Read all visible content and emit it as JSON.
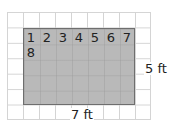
{
  "figure": {
    "width_label": "7 ft",
    "height_label": "5 ft",
    "counting_numbers": [
      "1",
      "2",
      "3",
      "4",
      "5",
      "6",
      "7",
      "8"
    ],
    "rectangle": {
      "columns": 7,
      "rows": 5,
      "fill": "#b9b9b9",
      "border": "#6e6e6e"
    },
    "grid": {
      "columns": 9,
      "rows": 7,
      "line_color": "#d4d4d4"
    }
  }
}
